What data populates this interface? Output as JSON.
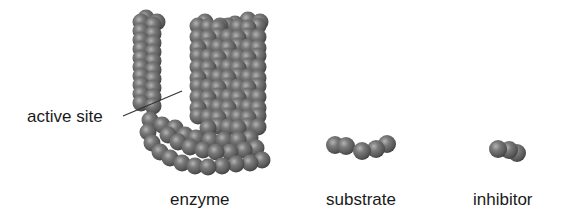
{
  "figure": {
    "labels": {
      "active_site": "active site",
      "enzyme": "enzyme",
      "substrate": "substrate",
      "inhibitor": "inhibitor"
    },
    "colors": {
      "sphere_base": "#6e6e6e",
      "sphere_highlight": "#a8a8a8",
      "sphere_shadow": "#3c3c3c",
      "leader_line": "#333333",
      "text": "#1a1a1a",
      "background": "#ffffff"
    }
  }
}
